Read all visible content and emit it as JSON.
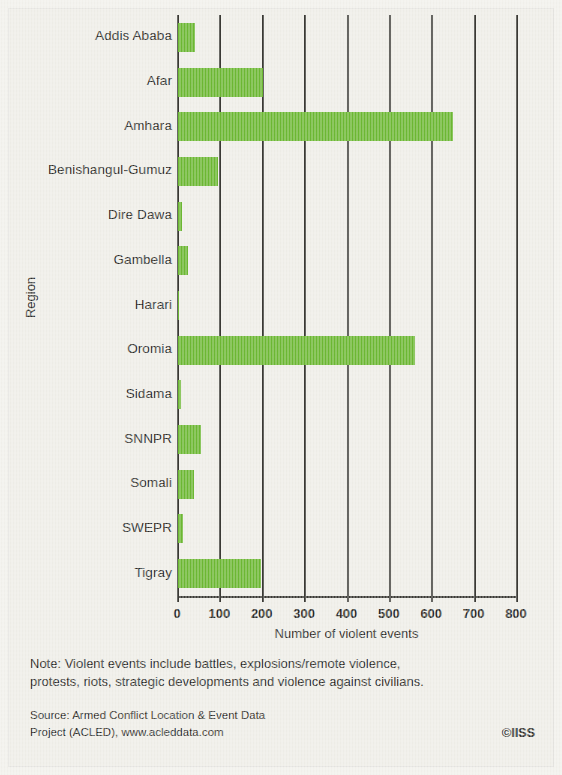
{
  "chart_data": {
    "type": "bar",
    "orientation": "horizontal",
    "title": "",
    "xlabel": "Number of violent events",
    "ylabel": "Region",
    "xlim": [
      0,
      800
    ],
    "xticks": [
      0,
      100,
      200,
      300,
      400,
      500,
      600,
      700,
      800
    ],
    "xtick_labels": [
      "0",
      "100",
      "200",
      "300",
      "400",
      "500",
      "600",
      "700",
      "800"
    ],
    "grid": "vertical",
    "legend": "none",
    "bar_color": "#6cb833",
    "categories": [
      "Addis Ababa",
      "Afar",
      "Amhara",
      "Benishangul-Gumuz",
      "Dire Dawa",
      "Gambella",
      "Harari",
      "Oromia",
      "Sidama",
      "SNNPR",
      "Somali",
      "SWEPR",
      "Tigray"
    ],
    "values": [
      40,
      200,
      650,
      95,
      10,
      24,
      2,
      560,
      8,
      55,
      38,
      12,
      195
    ]
  },
  "footer": {
    "note_line_1": "Note: Violent events include battles, explosions/remote violence,",
    "note_line_2": "protests, riots, strategic developments and violence against civilians.",
    "source_line_1": "Source: Armed Conflict Location & Event Data",
    "source_line_2": "Project (ACLED), www.acleddata.com",
    "credit": "©IISS"
  },
  "colors": {
    "bar": "#6cb833",
    "axis": "#3b3a35",
    "text": "#2a2a27",
    "background": "#efeee8"
  }
}
